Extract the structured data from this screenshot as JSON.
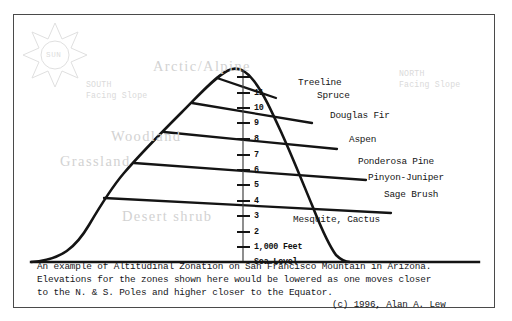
{
  "figure": {
    "title": "Altitudinal Zonation on San Francisco Mountain in Arizona",
    "sun": {
      "icon": "sun-icon",
      "label": "SUN"
    },
    "compass": {
      "south_line1": "SOUTH",
      "south_line2": "Facing Slope",
      "north_line1": "NORTH",
      "north_line2": "Facing Slope"
    },
    "zones": [
      {
        "label": "Arctic/Alpine"
      },
      {
        "label": "Woodland"
      },
      {
        "label": "Grassland"
      },
      {
        "label": "Desert shrub"
      }
    ],
    "vegetation": [
      {
        "label": "Treeline"
      },
      {
        "label": "Spruce"
      },
      {
        "label": "Douglas Fir"
      },
      {
        "label": "Aspen"
      },
      {
        "label": "Ponderosa Pine"
      },
      {
        "label": "Pinyon-Juniper"
      },
      {
        "label": "Sage Brush"
      },
      {
        "label": "Mesquite, Cactus"
      }
    ],
    "axis": {
      "ticks": [
        {
          "label": "Sea Level"
        },
        {
          "label": "1,000 Feet"
        },
        {
          "label": "2"
        },
        {
          "label": "3"
        },
        {
          "label": "4"
        },
        {
          "label": "5"
        },
        {
          "label": "6"
        },
        {
          "label": "7"
        },
        {
          "label": "8"
        },
        {
          "label": "9"
        },
        {
          "label": "10"
        },
        {
          "label": "11"
        },
        {
          "label": ""
        }
      ]
    },
    "caption": {
      "line1": "An example of Altitudinal Zonation on San Francisco Mountain in Arizona.",
      "line2": "Elevations for the zones shown here would be lowered as one moves closer",
      "line3": "to the N. & S. Poles and higher closer to the Equator.",
      "credit": "(c) 1996, Alan A. Lew"
    },
    "colors": {
      "ink": "#141414",
      "frame": "#4a4a4a",
      "pale": "#d2d2d2",
      "background": "#ffffff"
    }
  }
}
